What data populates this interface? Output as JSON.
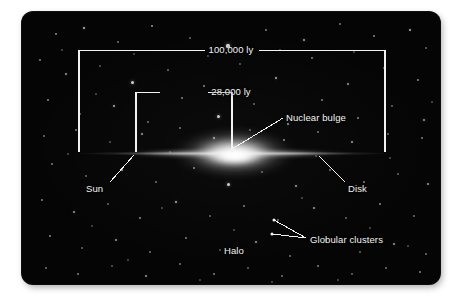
{
  "figure": {
    "type": "cross-section-diagram",
    "background_color": "#050505",
    "ink_color": "#f2f2f2",
    "page_color": "#ffffff"
  },
  "dimensions": [
    {
      "id": "galaxy-diameter",
      "label": "100,000 ly",
      "value": 100000,
      "unit": "ly",
      "orientation": "horizontal",
      "x_start": 57,
      "x_end": 363,
      "y": 38,
      "tick_bottom": 140
    },
    {
      "id": "sun-to-center",
      "label": "28,000 ly",
      "value": 28000,
      "unit": "ly",
      "orientation": "horizontal",
      "x_start": 114,
      "x_end": 210,
      "y": 80,
      "tick_bottom": 140
    }
  ],
  "callouts": [
    {
      "id": "nuclear-bulge",
      "label": "Nuclear bulge",
      "text_x": 264,
      "text_y": 101,
      "leader": [
        [
          261,
          106
        ],
        [
          210,
          137
        ]
      ]
    },
    {
      "id": "sun",
      "label": "Sun",
      "text_x": 64,
      "text_y": 172,
      "leader": [
        [
          88,
          170
        ],
        [
          112,
          143
        ]
      ]
    },
    {
      "id": "disk",
      "label": "Disk",
      "text_x": 326,
      "text_y": 172,
      "leader": [
        [
          323,
          170
        ],
        [
          297,
          144
        ]
      ]
    },
    {
      "id": "globular-clusters",
      "label": "Globular clusters",
      "text_x": 288,
      "text_y": 223,
      "leaders": [
        [
          [
            252,
            208
          ],
          [
            284,
            226
          ]
        ],
        [
          [
            250,
            222
          ],
          [
            284,
            226
          ]
        ]
      ],
      "marker_points": [
        [
          252,
          208
        ],
        [
          250,
          222
        ]
      ]
    },
    {
      "id": "halo",
      "label": "Halo",
      "text_x": 202,
      "text_y": 234,
      "leader": null
    }
  ],
  "galaxy": {
    "disk_label": "Disk",
    "bulge_label": "Nuclear bulge",
    "halo_label": "Halo",
    "plane_y": 141,
    "disk_x_start": 52,
    "disk_x_end": 372
  },
  "starfield": {
    "count": 118,
    "color": "#ffffff",
    "stars": [
      [
        34,
        22,
        1.1,
        0.55
      ],
      [
        62,
        16,
        1.4,
        0.75
      ],
      [
        96,
        30,
        1.0,
        0.45
      ],
      [
        130,
        14,
        1.2,
        0.6
      ],
      [
        168,
        26,
        1.0,
        0.4
      ],
      [
        206,
        34,
        1.6,
        0.85
      ],
      [
        244,
        18,
        1.1,
        0.5
      ],
      [
        282,
        28,
        1.3,
        0.65
      ],
      [
        318,
        12,
        1.0,
        0.45
      ],
      [
        352,
        24,
        1.2,
        0.55
      ],
      [
        388,
        18,
        1.4,
        0.7
      ],
      [
        404,
        36,
        1.0,
        0.4
      ],
      [
        18,
        48,
        1.1,
        0.5
      ],
      [
        44,
        62,
        1.3,
        0.6
      ],
      [
        78,
        54,
        1.0,
        0.35
      ],
      [
        110,
        70,
        1.5,
        0.8
      ],
      [
        146,
        58,
        1.1,
        0.45
      ],
      [
        182,
        74,
        1.2,
        0.55
      ],
      [
        218,
        52,
        1.0,
        0.4
      ],
      [
        254,
        66,
        1.4,
        0.7
      ],
      [
        290,
        46,
        1.1,
        0.5
      ],
      [
        326,
        72,
        1.3,
        0.6
      ],
      [
        362,
        56,
        1.0,
        0.4
      ],
      [
        396,
        68,
        1.2,
        0.55
      ],
      [
        26,
        88,
        1.2,
        0.55
      ],
      [
        58,
        102,
        1.0,
        0.4
      ],
      [
        92,
        94,
        1.4,
        0.7
      ],
      [
        126,
        110,
        1.1,
        0.45
      ],
      [
        160,
        86,
        1.2,
        0.5
      ],
      [
        196,
        104,
        1.5,
        0.8
      ],
      [
        232,
        92,
        1.0,
        0.4
      ],
      [
        266,
        112,
        1.3,
        0.6
      ],
      [
        300,
        88,
        1.1,
        0.5
      ],
      [
        336,
        106,
        1.2,
        0.55
      ],
      [
        370,
        94,
        1.0,
        0.4
      ],
      [
        402,
        108,
        1.3,
        0.6
      ],
      [
        22,
        124,
        1.1,
        0.45
      ],
      [
        54,
        118,
        1.2,
        0.5
      ],
      [
        88,
        130,
        1.0,
        0.35
      ],
      [
        120,
        122,
        1.3,
        0.6
      ],
      [
        158,
        116,
        1.1,
        0.45
      ],
      [
        192,
        126,
        1.4,
        0.7
      ],
      [
        228,
        118,
        1.0,
        0.4
      ],
      [
        262,
        128,
        1.2,
        0.55
      ],
      [
        296,
        120,
        1.1,
        0.45
      ],
      [
        330,
        130,
        1.3,
        0.6
      ],
      [
        366,
        122,
        1.0,
        0.4
      ],
      [
        400,
        126,
        1.2,
        0.5
      ],
      [
        30,
        152,
        1.2,
        0.5
      ],
      [
        64,
        164,
        1.0,
        0.4
      ],
      [
        100,
        158,
        1.3,
        0.6
      ],
      [
        134,
        170,
        1.1,
        0.45
      ],
      [
        172,
        156,
        1.2,
        0.55
      ],
      [
        206,
        172,
        1.5,
        0.8
      ],
      [
        240,
        160,
        1.0,
        0.4
      ],
      [
        274,
        174,
        1.3,
        0.6
      ],
      [
        308,
        158,
        1.1,
        0.45
      ],
      [
        342,
        170,
        1.2,
        0.5
      ],
      [
        376,
        162,
        1.0,
        0.4
      ],
      [
        406,
        172,
        1.3,
        0.6
      ],
      [
        20,
        188,
        1.1,
        0.5
      ],
      [
        52,
        200,
        1.3,
        0.6
      ],
      [
        86,
        192,
        1.0,
        0.4
      ],
      [
        118,
        206,
        1.2,
        0.55
      ],
      [
        154,
        190,
        1.4,
        0.7
      ],
      [
        188,
        204,
        1.0,
        0.4
      ],
      [
        222,
        194,
        1.2,
        0.5
      ],
      [
        256,
        208,
        1.1,
        0.45
      ],
      [
        292,
        196,
        1.3,
        0.6
      ],
      [
        324,
        206,
        1.0,
        0.4
      ],
      [
        358,
        192,
        1.2,
        0.55
      ],
      [
        392,
        204,
        1.1,
        0.45
      ],
      [
        28,
        224,
        1.2,
        0.55
      ],
      [
        60,
        236,
        1.0,
        0.4
      ],
      [
        94,
        228,
        1.3,
        0.6
      ],
      [
        128,
        240,
        1.1,
        0.45
      ],
      [
        164,
        226,
        1.2,
        0.5
      ],
      [
        198,
        238,
        1.0,
        0.35
      ],
      [
        234,
        230,
        1.3,
        0.6
      ],
      [
        268,
        244,
        1.1,
        0.45
      ],
      [
        304,
        228,
        1.2,
        0.55
      ],
      [
        338,
        240,
        1.0,
        0.4
      ],
      [
        372,
        232,
        1.3,
        0.6
      ],
      [
        404,
        242,
        1.1,
        0.45
      ],
      [
        24,
        256,
        1.1,
        0.45
      ],
      [
        56,
        262,
        1.2,
        0.5
      ],
      [
        90,
        254,
        1.0,
        0.35
      ],
      [
        124,
        264,
        1.3,
        0.6
      ],
      [
        158,
        252,
        1.1,
        0.45
      ],
      [
        192,
        262,
        1.2,
        0.5
      ],
      [
        226,
        256,
        1.0,
        0.4
      ],
      [
        260,
        264,
        1.1,
        0.45
      ],
      [
        296,
        254,
        1.2,
        0.5
      ],
      [
        330,
        262,
        1.0,
        0.4
      ],
      [
        364,
        256,
        1.1,
        0.45
      ],
      [
        398,
        260,
        1.2,
        0.5
      ],
      [
        40,
        38,
        0.9,
        0.3
      ],
      [
        74,
        82,
        0.9,
        0.3
      ],
      [
        112,
        42,
        0.9,
        0.3
      ],
      [
        148,
        140,
        0.9,
        0.3
      ],
      [
        186,
        44,
        0.9,
        0.3
      ],
      [
        224,
        146,
        0.9,
        0.3
      ],
      [
        258,
        38,
        0.9,
        0.3
      ],
      [
        294,
        144,
        0.9,
        0.3
      ],
      [
        332,
        40,
        0.9,
        0.3
      ],
      [
        368,
        146,
        0.9,
        0.3
      ],
      [
        46,
        142,
        0.9,
        0.3
      ],
      [
        410,
        90,
        0.9,
        0.3
      ],
      [
        70,
        214,
        0.9,
        0.3
      ],
      [
        140,
        196,
        0.9,
        0.3
      ],
      [
        212,
        218,
        0.9,
        0.3
      ],
      [
        280,
        186,
        0.9,
        0.3
      ],
      [
        348,
        216,
        0.9,
        0.3
      ],
      [
        386,
        234,
        0.9,
        0.3
      ],
      [
        106,
        248,
        0.9,
        0.3
      ],
      [
        178,
        268,
        0.9,
        0.3
      ],
      [
        250,
        270,
        0.9,
        0.3
      ],
      [
        316,
        268,
        0.9,
        0.3
      ]
    ]
  }
}
